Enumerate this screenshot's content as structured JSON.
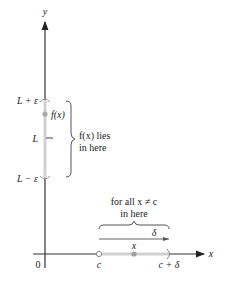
{
  "axes": {
    "y_label": "y",
    "x_label": "x",
    "origin_label": "0"
  },
  "y_interval": {
    "upper_label": "L + ε",
    "mid_label": "L",
    "lower_label": "L − ε",
    "point_label": "f(x)",
    "brace_text_line1": "f(x) lies",
    "brace_text_line2": "in here"
  },
  "x_interval": {
    "left_label": "c",
    "point_label": "x",
    "right_label": "c + δ",
    "delta_label": "δ",
    "brace_text_line1": "for all x ≠ c",
    "brace_text_line2": "in here"
  },
  "colors": {
    "axis": "#333333",
    "interval_band": "#d0d0d0",
    "point": "#a0a0a0",
    "text": "#222222"
  }
}
